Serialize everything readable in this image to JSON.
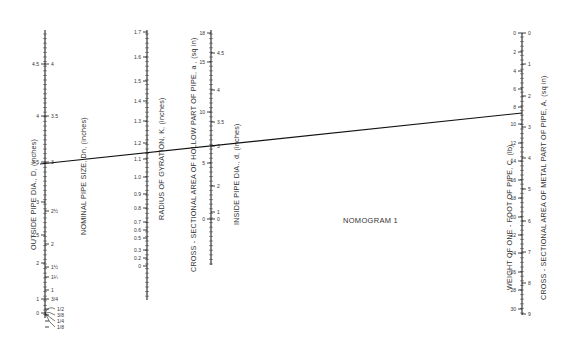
{
  "title": "NOMOGRAM 1",
  "scales": [
    {
      "id": "outside-dia",
      "title": "OUTSIDE PIPE DIA., D, (inches)",
      "side": "left",
      "x": 45,
      "ticks": [
        {
          "v": "0",
          "y": 313
        },
        {
          "v": "1",
          "y": 299
        },
        {
          "v": "2",
          "y": 263
        },
        {
          "v": "2.5",
          "y": 235
        },
        {
          "v": "3",
          "y": 202
        },
        {
          "v": "3.5",
          "y": 162
        },
        {
          "v": "4",
          "y": 116
        },
        {
          "v": "4.5",
          "y": 64
        }
      ]
    },
    {
      "id": "nominal-size",
      "title": "NOMINAL PIPE SIZE, Dn, (inches)",
      "side": "right",
      "x": 45,
      "ticks": [
        {
          "v": "1/8",
          "y": 327,
          "leader": true
        },
        {
          "v": "1/4",
          "y": 321,
          "leader": true
        },
        {
          "v": "3/8",
          "y": 315,
          "leader": true
        },
        {
          "v": "1/2",
          "y": 309,
          "leader": true
        },
        {
          "v": "3/4",
          "y": 299
        },
        {
          "v": "1",
          "y": 290
        },
        {
          "v": "1¼",
          "y": 277
        },
        {
          "v": "1½",
          "y": 267
        },
        {
          "v": "2",
          "y": 244
        },
        {
          "v": "2½",
          "y": 211
        },
        {
          "v": "3",
          "y": 162
        },
        {
          "v": "3.5",
          "y": 116
        },
        {
          "v": "4",
          "y": 64
        }
      ]
    },
    {
      "id": "radius-gyration",
      "title": "RADIUS OF GYRATION, K, (inches)",
      "side": "left",
      "x": 147,
      "ticks": [
        {
          "v": "0",
          "y": 266
        },
        {
          "v": "0.2",
          "y": 258
        },
        {
          "v": "0.3",
          "y": 250
        },
        {
          "v": "0.5",
          "y": 238
        },
        {
          "v": "0.6",
          "y": 230
        },
        {
          "v": "0.7",
          "y": 222
        },
        {
          "v": "0.8",
          "y": 208
        },
        {
          "v": "0.9",
          "y": 194
        },
        {
          "v": "1.0",
          "y": 177
        },
        {
          "v": "1.1",
          "y": 159
        },
        {
          "v": "1.2",
          "y": 143
        },
        {
          "v": "1.3",
          "y": 121
        },
        {
          "v": "1.4",
          "y": 101
        },
        {
          "v": "1.5",
          "y": 81
        },
        {
          "v": "1.6",
          "y": 57
        },
        {
          "v": "1.7",
          "y": 32
        }
      ]
    },
    {
      "id": "hollow-area",
      "title": "CROSS - SECTIONAL AREA OF HOLLOW PART OF PIPE, a , (sq in)",
      "side": "left",
      "x": 211,
      "ticks": [
        {
          "v": "0",
          "y": 219
        },
        {
          "v": "5",
          "y": 163
        },
        {
          "v": "10",
          "y": 112
        },
        {
          "v": "15",
          "y": 62
        },
        {
          "v": "18",
          "y": 33
        }
      ]
    },
    {
      "id": "inside-dia",
      "title": "INSIDE PIPE DIA., d, (inches)",
      "side": "right",
      "x": 211,
      "ticks": [
        {
          "v": "0",
          "y": 219
        },
        {
          "v": "1",
          "y": 212
        },
        {
          "v": "2",
          "y": 186
        },
        {
          "v": "3",
          "y": 146
        },
        {
          "v": "3.5",
          "y": 122
        },
        {
          "v": "4",
          "y": 90
        },
        {
          "v": "4.5",
          "y": 53
        }
      ]
    },
    {
      "id": "weight-per-foot",
      "title": "WEIGHT OF ONE - FOOT OF PIPE, C, (lb)",
      "side": "left",
      "x": 522,
      "ticks": [
        {
          "v": "0",
          "y": 33
        },
        {
          "v": "2",
          "y": 52
        },
        {
          "v": "4",
          "y": 71
        },
        {
          "v": "6",
          "y": 89
        },
        {
          "v": "8",
          "y": 107
        },
        {
          "v": "10",
          "y": 124
        },
        {
          "v": "12",
          "y": 143
        },
        {
          "v": "14",
          "y": 161
        },
        {
          "v": "16",
          "y": 180
        },
        {
          "v": "18",
          "y": 198
        },
        {
          "v": "20",
          "y": 217
        },
        {
          "v": "22",
          "y": 235
        },
        {
          "v": "24",
          "y": 253
        },
        {
          "v": "26",
          "y": 272
        },
        {
          "v": "28",
          "y": 290
        },
        {
          "v": "30",
          "y": 309
        }
      ]
    },
    {
      "id": "metal-area",
      "title": "CROSS - SECTIONAL AREA OF METAL PART OF PIPE, A, (sq in)",
      "side": "right",
      "x": 522,
      "ticks": [
        {
          "v": "0",
          "y": 33
        },
        {
          "v": "1",
          "y": 64
        },
        {
          "v": "2",
          "y": 96
        },
        {
          "v": "3",
          "y": 127
        },
        {
          "v": "4",
          "y": 158
        },
        {
          "v": "5",
          "y": 189
        },
        {
          "v": "6",
          "y": 221
        },
        {
          "v": "7",
          "y": 252
        },
        {
          "v": "8",
          "y": 283
        },
        {
          "v": "9",
          "y": 314
        }
      ]
    }
  ],
  "isopleth": {
    "label": "solution line",
    "from": {
      "x": 40,
      "y": 164
    },
    "to": {
      "x": 522,
      "y": 113
    }
  }
}
